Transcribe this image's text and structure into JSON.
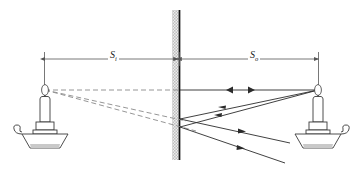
{
  "figure": {
    "type": "optics-ray-diagram",
    "background": "#ffffff"
  },
  "labels": {
    "image_distance": {
      "symbol": "S",
      "subscript": "i",
      "full": "Si"
    },
    "object_distance": {
      "symbol": "S",
      "subscript": "o",
      "full": "So"
    }
  },
  "colors": {
    "ink": "#1a1a1a",
    "ray_solid": "#2b2b2b",
    "ray_virtual": "#8a8a8a",
    "dimension": "#555555",
    "mirror_line": "#111111",
    "mirror_hatch_light": "#e2e2e2",
    "mirror_hatch_dark": "#bdbdbd",
    "candle_fill": "#ffffff",
    "candle_shadow": "#c9c9c9"
  },
  "geometry": {
    "mirror": {
      "x": 180,
      "y_top": 10,
      "y_bottom": 160,
      "hatch_width": 7
    },
    "image_flame": {
      "x": 45,
      "y": 90
    },
    "object_flame": {
      "x": 318,
      "y": 90
    },
    "dimension_line_y": 59,
    "dimension_left_x": 44,
    "dimension_right_x": 318
  },
  "elements": {
    "mirror": "vertical-mirror",
    "virtual_candle": "image-candle-left",
    "real_candle": "object-candle-right",
    "virtual_rays": "dashed-backward-extensions",
    "incident_rays": "solid-rays-to-mirror",
    "reflected_rays": "solid-rays-from-mirror",
    "axis_ray": "horizontal-principal-ray"
  }
}
